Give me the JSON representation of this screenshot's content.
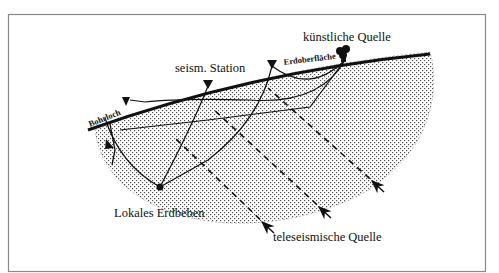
{
  "labels": {
    "artificial_source": "künstliche Quelle",
    "surface": "Erdoberfläche",
    "station": "seism. Station",
    "borehole": "Bohrloch",
    "local_quake": "Lokales Erdbeben",
    "teleseismic": "teleseismische Quelle"
  },
  "colors": {
    "ink": "#111111",
    "frame": "#8a8a8a",
    "background": "#ffffff"
  },
  "icons": {
    "station_marker": "inverted-triangle",
    "source_marker": "explosion-blob",
    "quake_marker": "filled-dot",
    "ray_arrow": "arrowhead"
  }
}
